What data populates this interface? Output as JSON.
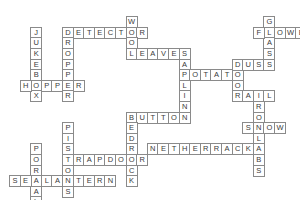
{
  "puzzle": {
    "type": "crossword",
    "words": [
      {
        "word": "DETECTOR",
        "dir": "across",
        "row": 2,
        "col": 5
      },
      {
        "word": "WOOL",
        "dir": "down",
        "row": 1,
        "col": 11
      },
      {
        "word": "LEAVES",
        "dir": "across",
        "row": 4,
        "col": 11
      },
      {
        "word": "SAPLING",
        "dir": "down",
        "row": 4,
        "col": 16
      },
      {
        "word": "POTATO",
        "dir": "across",
        "row": 6,
        "col": 16
      },
      {
        "word": "DOOR",
        "dir": "down",
        "row": 5,
        "col": 21
      },
      {
        "word": "DUST",
        "dir": "across",
        "row": 5,
        "col": 21
      },
      {
        "word": "GLASS",
        "dir": "down",
        "row": 1,
        "col": 24
      },
      {
        "word": "FLOWER",
        "dir": "across",
        "row": 2,
        "col": 23
      },
      {
        "word": "RAIL",
        "dir": "across",
        "row": 8,
        "col": 21
      },
      {
        "word": "ROSLABS",
        "dir": "down",
        "row": 9,
        "col": 23
      },
      {
        "word": "SNOW",
        "dir": "across",
        "row": 11,
        "col": 22
      },
      {
        "word": "NETHERRACK",
        "dir": "across",
        "row": 13,
        "col": 13
      },
      {
        "word": "BUTTON",
        "dir": "across",
        "row": 10,
        "col": 11
      },
      {
        "word": "BEDROCK",
        "dir": "down",
        "row": 10,
        "col": 11
      },
      {
        "word": "JUKEBOX",
        "dir": "down",
        "row": 2,
        "col": 2
      },
      {
        "word": "DROPPER",
        "dir": "down",
        "row": 2,
        "col": 5
      },
      {
        "word": "HOPPER",
        "dir": "across",
        "row": 7,
        "col": 1
      },
      {
        "word": "PISTONS",
        "dir": "down",
        "row": 11,
        "col": 5
      },
      {
        "word": "TRAPDOOR",
        "dir": "across",
        "row": 14,
        "col": 5
      },
      {
        "word": "PORTAL",
        "dir": "down",
        "row": 13,
        "col": 2
      },
      {
        "word": "SEALANTERN",
        "dir": "across",
        "row": 16,
        "col": 0
      }
    ]
  }
}
